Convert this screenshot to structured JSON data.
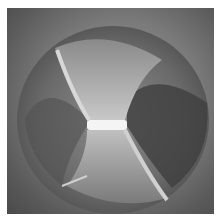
{
  "image": {
    "subject": "drill-bit-tip-end-view",
    "colors": {
      "background": "#ffffff",
      "outer": "#5a5a5a",
      "disc": "#6e6e6e",
      "flank": "#b4b4b4",
      "highlight": "#f4f4f4",
      "flute": "#3c3c3c"
    }
  }
}
